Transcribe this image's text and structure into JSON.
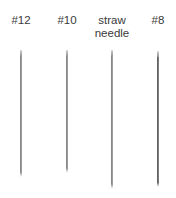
{
  "needles": [
    {
      "label": "#12",
      "x": 21,
      "top": 50,
      "bottom": 177,
      "color": "#8c8c8c",
      "width": 1.5
    },
    {
      "label": "#10",
      "x": 67,
      "top": 50,
      "bottom": 173,
      "color": "#8a8a8a",
      "width": 1.5
    },
    {
      "label": "straw\nneedle",
      "x": 112,
      "top": 50,
      "bottom": 189,
      "color": "#888888",
      "width": 1.6
    },
    {
      "label": "#8",
      "x": 158,
      "top": 51,
      "bottom": 187,
      "color": "#666666",
      "width": 2
    }
  ],
  "labels": {
    "n12": "#12",
    "n10": "#10",
    "straw_line1": "straw",
    "straw_line2": "needle",
    "n8": "#8"
  },
  "colors": {
    "background": "#ffffff",
    "label_text": "#3a3a3a",
    "needle_steel": "#8c8c8c"
  }
}
